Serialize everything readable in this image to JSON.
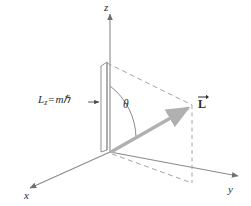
{
  "figure": {
    "background_color": "#ffffff",
    "axes": {
      "z_label": "z",
      "x_label": "x",
      "y_label": "y",
      "axis_color": "#8a8a8a"
    },
    "labels": {
      "lz_symbol": "L",
      "lz_subscript": "z",
      "lz_equals": "=",
      "lz_value": "mℏ",
      "theta": "θ",
      "l_vector": "L"
    },
    "colors": {
      "vector": "#b0b0b0",
      "dashed": "#9a9a9a",
      "bar_outline": "#8f8f8f",
      "text": "#2b2b2b"
    },
    "geometry": {
      "origin_x": 110,
      "origin_y": 152,
      "z_top_y": 12,
      "lz_top_y": 62,
      "l_tip_x": 192,
      "l_tip_y": 105,
      "theta_degrees": 55
    }
  }
}
